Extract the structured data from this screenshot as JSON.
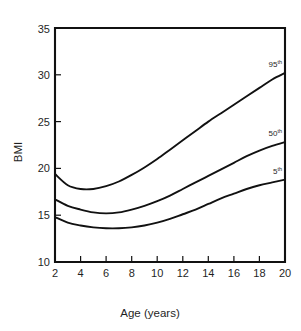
{
  "chart_data": {
    "type": "line",
    "title": "",
    "xlabel": "Age (years)",
    "ylabel": "BMI",
    "xlim": [
      2,
      20
    ],
    "ylim": [
      10,
      35
    ],
    "grid": false,
    "legend_position": "right-inline-end-of-curve",
    "x_ticks": [
      "2",
      "4",
      "6",
      "8",
      "10",
      "12",
      "14",
      "16",
      "18",
      "20"
    ],
    "x_tick_values": [
      2,
      4,
      6,
      8,
      10,
      12,
      14,
      16,
      18,
      20
    ],
    "y_ticks": [
      "10",
      "15",
      "20",
      "25",
      "30",
      "35"
    ],
    "y_tick_values": [
      10,
      15,
      20,
      25,
      30,
      35
    ],
    "x": [
      2,
      3,
      4,
      5,
      6,
      7,
      8,
      9,
      10,
      11,
      12,
      13,
      14,
      15,
      16,
      17,
      18,
      19,
      20
    ],
    "series": [
      {
        "name": "95th",
        "label_text": "95",
        "label_sup": "th",
        "values": [
          19.4,
          18.2,
          17.8,
          17.8,
          18.1,
          18.6,
          19.3,
          20.1,
          21.0,
          22.0,
          23.0,
          24.0,
          25.0,
          25.9,
          26.8,
          27.7,
          28.6,
          29.5,
          30.2
        ]
      },
      {
        "name": "50th",
        "label_text": "50",
        "label_sup": "th",
        "values": [
          16.7,
          16.0,
          15.6,
          15.3,
          15.2,
          15.3,
          15.6,
          16.0,
          16.5,
          17.1,
          17.8,
          18.5,
          19.2,
          19.9,
          20.6,
          21.3,
          21.9,
          22.4,
          22.8
        ]
      },
      {
        "name": "5th",
        "label_text": "5",
        "label_sup": "th",
        "values": [
          14.8,
          14.2,
          13.9,
          13.7,
          13.6,
          13.6,
          13.7,
          13.9,
          14.2,
          14.6,
          15.1,
          15.6,
          16.2,
          16.8,
          17.3,
          17.8,
          18.2,
          18.5,
          18.8
        ]
      }
    ],
    "colors": {
      "curve": "#111111",
      "axis": "#111111",
      "background": "#ffffff",
      "text": "#1f1f1f"
    }
  },
  "labels": {
    "y_axis_title": "BMI",
    "x_axis_title": "Age (years)"
  }
}
